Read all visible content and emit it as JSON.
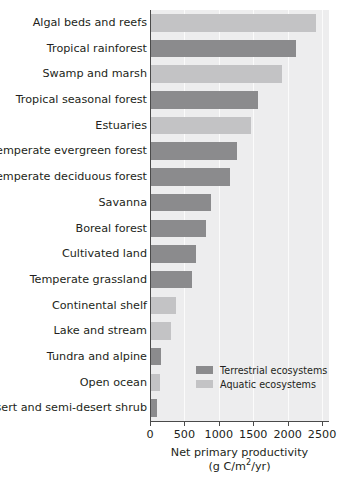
{
  "chart_data": {
    "type": "bar",
    "orientation": "horizontal",
    "title": "",
    "xlabel": "Net primary productivity (g C/m2/yr)",
    "xlabel_line1": "Net primary productivity",
    "xlabel_line2_pre": "(g C/m",
    "xlabel_line2_sup": "2",
    "xlabel_line2_post": "/yr)",
    "ylabel": "",
    "xlim": [
      0,
      2600
    ],
    "xticks": [
      0,
      500,
      1000,
      1500,
      2000,
      2500
    ],
    "xtick_labels": [
      "0",
      "500",
      "1000",
      "1500",
      "2000",
      "2500"
    ],
    "grid": true,
    "legend_position": "inside-bottom-right",
    "categories": [
      "Algal beds and reefs",
      "Tropical rainforest",
      "Swamp and marsh",
      "Tropical seasonal forest",
      "Estuaries",
      "Temperate evergreen forest",
      "Temperate deciduous forest",
      "Savanna",
      "Boreal forest",
      "Cultivated land",
      "Temperate grassland",
      "Continental shelf",
      "Lake and stream",
      "Tundra and alpine",
      "Open ocean",
      "Desert and semi-desert shrub"
    ],
    "values": [
      2400,
      2100,
      1900,
      1550,
      1450,
      1250,
      1150,
      870,
      800,
      650,
      600,
      360,
      290,
      140,
      125,
      90
    ],
    "groups": [
      "aquatic",
      "terrestrial",
      "aquatic",
      "terrestrial",
      "aquatic",
      "terrestrial",
      "terrestrial",
      "terrestrial",
      "terrestrial",
      "terrestrial",
      "terrestrial",
      "aquatic",
      "aquatic",
      "terrestrial",
      "aquatic",
      "terrestrial"
    ],
    "series": [
      {
        "name": "Terrestrial ecosystems",
        "color": "#8b8b8d",
        "points": [
          {
            "category": "Tropical rainforest",
            "value": 2100
          },
          {
            "category": "Tropical seasonal forest",
            "value": 1550
          },
          {
            "category": "Temperate evergreen forest",
            "value": 1250
          },
          {
            "category": "Temperate deciduous forest",
            "value": 1150
          },
          {
            "category": "Savanna",
            "value": 870
          },
          {
            "category": "Boreal forest",
            "value": 800
          },
          {
            "category": "Cultivated land",
            "value": 650
          },
          {
            "category": "Temperate grassland",
            "value": 600
          },
          {
            "category": "Tundra and alpine",
            "value": 140
          },
          {
            "category": "Desert and semi-desert shrub",
            "value": 90
          }
        ]
      },
      {
        "name": "Aquatic ecosystems",
        "color": "#c3c3c5",
        "points": [
          {
            "category": "Algal beds and reefs",
            "value": 2400
          },
          {
            "category": "Swamp and marsh",
            "value": 1900
          },
          {
            "category": "Estuaries",
            "value": 1450
          },
          {
            "category": "Continental shelf",
            "value": 360
          },
          {
            "category": "Lake and stream",
            "value": 290
          },
          {
            "category": "Open ocean",
            "value": 125
          }
        ]
      }
    ]
  },
  "legend": {
    "items": [
      {
        "label": "Terrestrial ecosystems",
        "group": "terrestrial",
        "color": "#8b8b8d"
      },
      {
        "label": "Aquatic ecosystems",
        "group": "aquatic",
        "color": "#c3c3c5"
      }
    ]
  },
  "colors": {
    "terrestrial": "#8b8b8d",
    "aquatic": "#c3c3c5",
    "plot_background": "#ededee",
    "gridline": "#fbfbfb",
    "axis": "#4a4a4a",
    "text": "#231f20"
  }
}
